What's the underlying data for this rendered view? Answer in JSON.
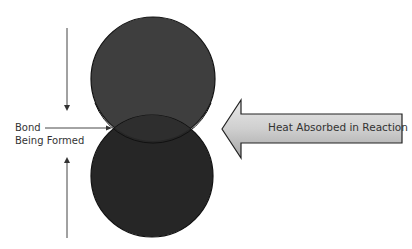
{
  "diagram": {
    "labels": {
      "bond_line1": "Bond",
      "bond_line2": "Being Formed",
      "heat_arrow": "Heat Absorbed in Reaction"
    },
    "colors": {
      "top_atom": "#3e3e3e",
      "bottom_atom": "#262626",
      "overlap": "#2e2e2e",
      "outline": "#111111",
      "heat_arrow_light": "#e6e6e6",
      "heat_arrow_dark": "#a8a8a8",
      "text": "#333333"
    }
  }
}
